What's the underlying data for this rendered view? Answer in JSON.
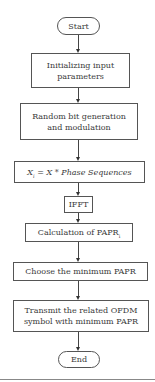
{
  "flowchart": {
    "nodes": [
      {
        "id": "start",
        "shape": "terminal",
        "label": "Start"
      },
      {
        "id": "init",
        "shape": "process",
        "label": "Initializing input parameters"
      },
      {
        "id": "random",
        "shape": "process",
        "label": "Random bit generation and modulation"
      },
      {
        "id": "phase",
        "shape": "process",
        "label_main": "X",
        "label_sub": "i",
        "label_rest": " = X * Phase Sequences"
      },
      {
        "id": "ifft",
        "shape": "process",
        "label": "IFFT"
      },
      {
        "id": "calc",
        "shape": "process",
        "label_main": "Calculation of PAPR",
        "label_sub": "i"
      },
      {
        "id": "choose",
        "shape": "process",
        "label": "Choose the minimum PAPR"
      },
      {
        "id": "transmit",
        "shape": "process",
        "label": "Transmit the related OFDM symbol with minimum PAPR"
      },
      {
        "id": "end",
        "shape": "terminal",
        "label": "End"
      }
    ],
    "edges": [
      [
        "start",
        "init"
      ],
      [
        "init",
        "random"
      ],
      [
        "random",
        "phase"
      ],
      [
        "phase",
        "ifft"
      ],
      [
        "ifft",
        "calc"
      ],
      [
        "calc",
        "choose"
      ],
      [
        "choose",
        "transmit"
      ],
      [
        "transmit",
        "end"
      ]
    ]
  }
}
